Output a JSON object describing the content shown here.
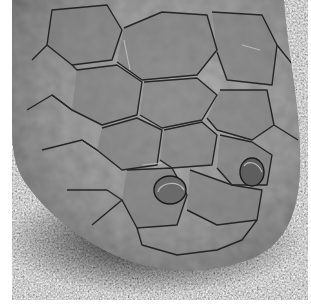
{
  "image": {
    "kind": "photograph",
    "subject": "snake head, dorsal view",
    "tone": "grayscale",
    "alt": "Close-up black-and-white photograph of a snake's head from above showing large polygonal head scales and two nostrils, resting on a speckled textured surface"
  },
  "colors": {
    "background_ground": "#9a9a9a",
    "scale_mid": "#6e6e6e",
    "scale_dark": "#2a2a2a",
    "scale_edge": "#1a1a1a",
    "highlight": "#bdbdbd",
    "shadow": "#0d0d0d",
    "border": "#ffffff"
  }
}
